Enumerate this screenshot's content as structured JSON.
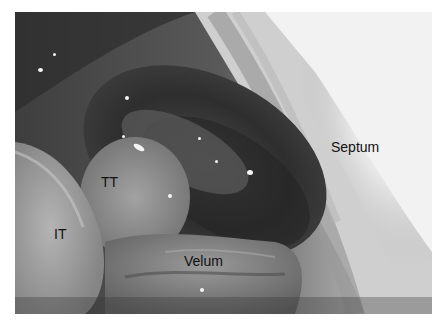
{
  "figure": {
    "labels": {
      "septum": "Septum",
      "tt": "TT",
      "it": "IT",
      "velum": "Velum"
    }
  }
}
